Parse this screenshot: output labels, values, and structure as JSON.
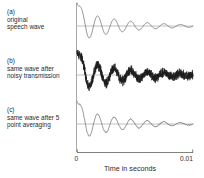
{
  "figure": {
    "panels": [
      {
        "tag": "(a)",
        "caption_line1": "original",
        "caption_line2": "speech wave",
        "name": "original-speech-wave"
      },
      {
        "tag": "(b)",
        "caption_line1": "same wave after",
        "caption_line2": "noisy transmission",
        "name": "noisy-transmission-wave"
      },
      {
        "tag": "(c)",
        "caption_line1": "same wave after 5",
        "caption_line2": "point averaging",
        "name": "five-point-averaged-wave"
      }
    ],
    "axis": {
      "title": "Time in seconds",
      "tick_min": "0",
      "tick_max": "0.01"
    },
    "colors": {
      "wave": "#555555",
      "wave_noisy": "#1c1c1c",
      "baseline": "#8d8d8d",
      "axis": "#4a4a4a",
      "text": "#2b2b2b",
      "background": "#ffffff"
    }
  },
  "chart_data": {
    "type": "line",
    "title": "",
    "xlabel": "Time in seconds",
    "ylabel": "",
    "xlim": [
      0,
      0.01
    ],
    "xticks": [
      0,
      0.01
    ],
    "xticklabels": [
      "0",
      "0.01"
    ],
    "grid": false,
    "legend": null,
    "panels": [
      {
        "label": "(a) original speech wave",
        "series_name": "original",
        "model": "damped_sinusoid",
        "amplitude_initial": 1.0,
        "decay_per_second": 260,
        "frequency_hz": 700,
        "initial_spike_amplitude": 1.45,
        "noise_amplitude": 0.0
      },
      {
        "label": "(b) same wave after noisy transmission",
        "series_name": "noisy",
        "model": "damped_sinusoid_plus_noise",
        "amplitude_initial": 1.0,
        "decay_per_second": 260,
        "frequency_hz": 700,
        "initial_spike_amplitude": 1.45,
        "noise_amplitude": 0.22
      },
      {
        "label": "(c) same wave after 5 point averaging",
        "series_name": "smoothed",
        "model": "damped_sinusoid_plus_smoothed_noise",
        "amplitude_initial": 1.0,
        "decay_per_second": 260,
        "frequency_hz": 700,
        "initial_spike_amplitude": 1.45,
        "noise_amplitude": 0.05,
        "smoothing_window": 5
      }
    ]
  }
}
